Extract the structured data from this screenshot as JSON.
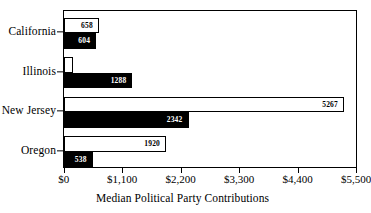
{
  "chart_data": {
    "type": "bar",
    "orientation": "horizontal",
    "title": "",
    "xlabel": "Median Political Party Contributions",
    "ylabel": "",
    "categories": [
      "California",
      "Illinois",
      "New Jersey",
      "Oregon"
    ],
    "xlim": [
      0,
      5500
    ],
    "xticks": [
      0,
      1100,
      2200,
      3300,
      4400,
      5500
    ],
    "xticklabels": [
      "$0",
      "$1,100",
      "$2,200",
      "$3,300",
      "$4,400",
      "$5,500"
    ],
    "grid": false,
    "legend": "none",
    "series": [
      {
        "name": "upper",
        "style": "white-filled-black-outline",
        "color": "#ffffff",
        "values": [
          658,
          160,
          5267,
          1920
        ],
        "labels": [
          "658",
          "",
          "5267",
          "1920"
        ]
      },
      {
        "name": "lower",
        "style": "black-filled",
        "color": "#000000",
        "values": [
          604,
          1288,
          2342,
          538
        ],
        "labels": [
          "604",
          "1288",
          "2342",
          "538"
        ]
      }
    ]
  },
  "axis": {
    "title": "Median Political Party Contributions"
  }
}
